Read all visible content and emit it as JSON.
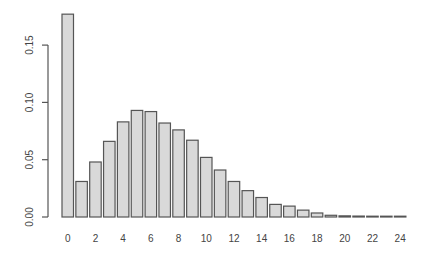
{
  "chart_data": {
    "type": "bar",
    "title": "",
    "xlabel": "",
    "ylabel": "",
    "categories": [
      "0",
      "1",
      "2",
      "3",
      "4",
      "5",
      "6",
      "7",
      "8",
      "9",
      "10",
      "11",
      "12",
      "13",
      "14",
      "15",
      "16",
      "17",
      "18",
      "19",
      "20",
      "21",
      "22",
      "23",
      "24"
    ],
    "values": [
      0.177,
      0.031,
      0.048,
      0.066,
      0.083,
      0.093,
      0.092,
      0.082,
      0.076,
      0.067,
      0.052,
      0.041,
      0.031,
      0.023,
      0.017,
      0.011,
      0.0095,
      0.006,
      0.0035,
      0.0015,
      0.001,
      0.0008,
      0.0006,
      0.0005,
      0.0004
    ],
    "xtick_labels": [
      "0",
      "2",
      "4",
      "6",
      "8",
      "10",
      "12",
      "14",
      "16",
      "18",
      "20",
      "22",
      "24"
    ],
    "ytick_labels": [
      "0.00",
      "0.05",
      "0.10",
      "0.15"
    ],
    "yticks": [
      0.0,
      0.05,
      0.1,
      0.15
    ],
    "ylim": [
      0,
      0.18
    ],
    "grid": false,
    "legend": null,
    "bar_fill": "#d9d9d9",
    "bar_border": "#555555"
  }
}
